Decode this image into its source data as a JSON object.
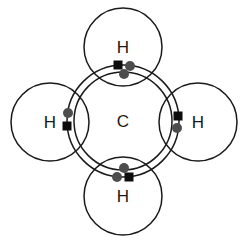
{
  "figure": {
    "background_color": "#ffffff",
    "width": 247,
    "height": 241
  },
  "colors": {
    "outline": "#1a1a1a",
    "hydrogen_electron": "#4d4d4d",
    "carbon_electron": "#0d0d0d",
    "label_text": "#1a1a1a",
    "background": "#ffffff"
  },
  "center_atom": {
    "symbol": "C",
    "name": "carbon",
    "cx": 123,
    "cy": 121,
    "inner_shell_radius": 49,
    "outer_shell_radius": 56
  },
  "hydrogen_atoms": [
    {
      "symbol": "H",
      "name": "hydrogen-top",
      "position": "top",
      "cx": 123,
      "cy": 47,
      "r": 39
    },
    {
      "symbol": "H",
      "name": "hydrogen-left",
      "position": "left",
      "cx": 50,
      "cy": 122,
      "r": 39
    },
    {
      "symbol": "H",
      "name": "hydrogen-right",
      "position": "right",
      "cx": 198,
      "cy": 122,
      "r": 39
    },
    {
      "symbol": "H",
      "name": "hydrogen-bottom",
      "position": "bottom",
      "cx": 123,
      "cy": 196,
      "r": 39
    }
  ],
  "bond_electrons": [
    {
      "name": "carbon-electron-top",
      "shape": "square",
      "cx": 118,
      "cy": 65,
      "size": 9
    },
    {
      "name": "hydrogen-electron-top",
      "shape": "circle",
      "cx": 130,
      "cy": 66,
      "r": 5
    },
    {
      "name": "shell-electron-upper",
      "shape": "circle",
      "cx": 124,
      "cy": 74,
      "r": 5
    },
    {
      "name": "hydrogen-electron-left",
      "shape": "circle",
      "cx": 68,
      "cy": 113,
      "r": 5
    },
    {
      "name": "carbon-electron-left",
      "shape": "square",
      "cx": 67,
      "cy": 126,
      "size": 9
    },
    {
      "name": "carbon-electron-right",
      "shape": "square",
      "cx": 178,
      "cy": 116,
      "size": 9
    },
    {
      "name": "hydrogen-electron-right",
      "shape": "circle",
      "cx": 177,
      "cy": 128,
      "r": 5
    },
    {
      "name": "shell-electron-lower",
      "shape": "circle",
      "cx": 124,
      "cy": 168,
      "r": 5
    },
    {
      "name": "hydrogen-electron-bottom",
      "shape": "circle",
      "cx": 117,
      "cy": 177,
      "r": 5
    },
    {
      "name": "carbon-electron-bottom",
      "shape": "square",
      "cx": 129,
      "cy": 177,
      "size": 9
    }
  ]
}
